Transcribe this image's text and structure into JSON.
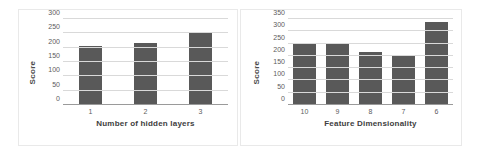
{
  "figure": {
    "background": "#ffffff",
    "bar_color": "#595959",
    "grid_color": "#d9d9d9",
    "axis_color": "#9a9a9a",
    "panel_border_color": "#e9e9e9"
  },
  "chart_data": [
    {
      "type": "bar",
      "title": "",
      "xlabel": "Number of hidden layers",
      "ylabel": "Score",
      "categories": [
        "1",
        "2",
        "3"
      ],
      "values": [
        207,
        216,
        250
      ],
      "yticks": [
        0,
        50,
        100,
        150,
        200,
        250,
        300
      ],
      "ytick_labels": [
        "0",
        "50",
        "100",
        "150",
        "200",
        "250",
        "300"
      ],
      "ylim": [
        0,
        300
      ],
      "grid": true,
      "legend": false,
      "series": [
        {
          "name": "Score",
          "values": [
            207,
            216,
            250
          ]
        }
      ]
    },
    {
      "type": "bar",
      "title": "",
      "xlabel": "Feature Dimensionality",
      "ylabel": "Score",
      "categories": [
        "10",
        "9",
        "8",
        "7",
        "6"
      ],
      "values": [
        252,
        252,
        216,
        205,
        338
      ],
      "yticks": [
        0,
        50,
        100,
        150,
        200,
        250,
        300,
        350
      ],
      "ytick_labels": [
        "0",
        "50",
        "100",
        "150",
        "200",
        "250",
        "300",
        "350"
      ],
      "ylim": [
        0,
        350
      ],
      "grid": true,
      "legend": false,
      "series": [
        {
          "name": "Score",
          "values": [
            252,
            252,
            216,
            205,
            338
          ]
        }
      ]
    }
  ]
}
